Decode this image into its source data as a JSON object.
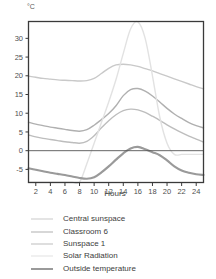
{
  "unit_label": "°C",
  "legend": {
    "position": "below-plot",
    "entries": [
      {
        "label": "Central sunspace",
        "color": "#c9c9c9",
        "width": 1.4
      },
      {
        "label": "Classroom 6",
        "color": "#b0b0b0",
        "width": 1.4
      },
      {
        "label": "Sunspace 1",
        "color": "#bdbdbd",
        "width": 1.4
      },
      {
        "label": "Solar Radiation",
        "color": "#e2e2e2",
        "width": 1.4
      },
      {
        "label": "Outside temperature",
        "color": "#9a9a9a",
        "width": 2.2
      }
    ]
  },
  "chart_data": {
    "type": "line",
    "title": "",
    "subtitle": "",
    "xlabel": "Hours",
    "ylabel": "°C",
    "xlim": [
      1,
      25
    ],
    "ylim": [
      -8.5,
      34.5
    ],
    "grid": false,
    "zero_line": true,
    "x_ticks": [
      2,
      4,
      6,
      8,
      10,
      12,
      14,
      16,
      18,
      20,
      22,
      24
    ],
    "y_ticks": [
      -5,
      0,
      5,
      10,
      15,
      20,
      25,
      30
    ],
    "x": [
      1,
      2,
      3,
      4,
      5,
      6,
      7,
      8,
      9,
      10,
      11,
      12,
      13,
      14,
      15,
      16,
      17,
      18,
      19,
      20,
      21,
      22,
      23,
      24,
      25
    ],
    "series": [
      {
        "name": "Central sunspace",
        "color": "#c9c9c9",
        "width": 1.4,
        "values": [
          19.9,
          19.6,
          19.3,
          19.1,
          18.9,
          18.8,
          18.7,
          18.6,
          18.7,
          19.3,
          20.6,
          22.0,
          22.9,
          23.1,
          22.9,
          22.5,
          21.9,
          21.3,
          20.6,
          19.9,
          19.2,
          18.5,
          17.8,
          17.1,
          16.5
        ]
      },
      {
        "name": "Classroom 6",
        "color": "#b0b0b0",
        "width": 1.4,
        "values": [
          7.6,
          7.1,
          6.7,
          6.3,
          6.0,
          5.7,
          5.4,
          5.2,
          5.6,
          6.8,
          8.3,
          9.9,
          12.0,
          14.7,
          16.3,
          16.6,
          15.9,
          14.6,
          13.0,
          11.3,
          9.8,
          8.6,
          7.5,
          6.7,
          6.1
        ]
      },
      {
        "name": "Sunspace 1",
        "color": "#bdbdbd",
        "width": 1.4,
        "values": [
          4.2,
          3.7,
          3.3,
          3.0,
          2.7,
          2.4,
          2.2,
          2.0,
          2.5,
          4.0,
          6.1,
          8.0,
          9.6,
          10.7,
          11.1,
          10.9,
          10.2,
          9.2,
          8.1,
          6.9,
          5.8,
          4.8,
          3.9,
          3.1,
          2.3
        ]
      },
      {
        "name": "Solar Radiation",
        "color": "#e2e2e2",
        "width": 1.4,
        "values": [
          -8.4,
          -8.4,
          -8.4,
          -8.4,
          -8.4,
          -8.4,
          -8.4,
          -8.4,
          -3.5,
          2.0,
          7.5,
          13.0,
          19.0,
          26.0,
          32.5,
          34.4,
          30.0,
          20.0,
          9.0,
          2.0,
          -1.0,
          -1.0,
          -1.0,
          -1.0,
          -1.0
        ]
      },
      {
        "name": "Outside temperature",
        "color": "#9a9a9a",
        "width": 2.2,
        "values": [
          -4.7,
          -5.1,
          -5.5,
          -5.9,
          -6.2,
          -6.5,
          -6.9,
          -7.3,
          -7.5,
          -7.1,
          -5.8,
          -4.2,
          -2.4,
          -0.7,
          0.6,
          1.0,
          0.4,
          -0.4,
          -1.2,
          -2.6,
          -4.2,
          -5.3,
          -5.9,
          -6.3,
          -6.5
        ]
      }
    ]
  }
}
